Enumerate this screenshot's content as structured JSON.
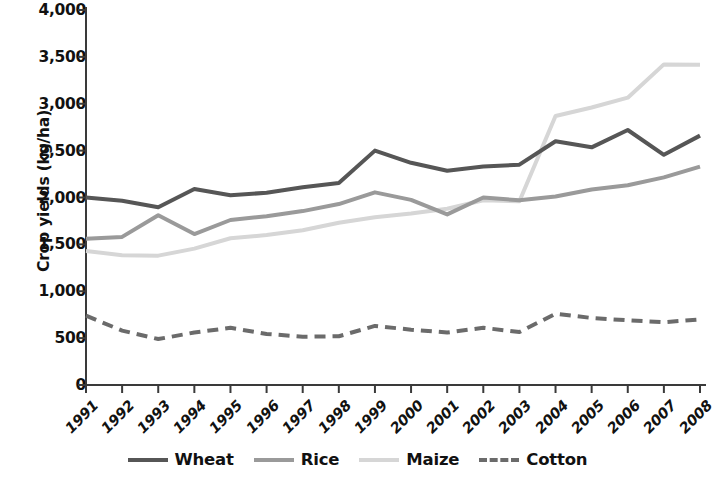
{
  "chart_data": {
    "type": "line",
    "title": "",
    "xlabel": "",
    "ylabel": "Crop yields (kg/ha)",
    "grid": false,
    "legend_position": "bottom",
    "xlim": [
      1991,
      2008
    ],
    "ylim": [
      0,
      4000
    ],
    "y_ticks": [
      0,
      500,
      1000,
      1500,
      2000,
      2500,
      3000,
      3500,
      4000
    ],
    "y_tick_labels": [
      "0",
      "500",
      "1,000",
      "1,500",
      "2,000",
      "2,500",
      "3,000",
      "3,500",
      "4,000"
    ],
    "categories": [
      "1991",
      "1992",
      "1993",
      "1994",
      "1995",
      "1996",
      "1997",
      "1998",
      "1999",
      "2000",
      "2001",
      "2002",
      "2003",
      "2004",
      "2005",
      "2006",
      "2007",
      "2008"
    ],
    "series": [
      {
        "name": "Wheat",
        "color": "#565656",
        "style": "solid",
        "width": 4,
        "values": [
          2000,
          1965,
          1895,
          2090,
          2025,
          2050,
          2110,
          2155,
          2500,
          2370,
          2285,
          2330,
          2350,
          2600,
          2535,
          2720,
          2455,
          2660
        ]
      },
      {
        "name": "Rice",
        "color": "#9a9a9a",
        "style": "solid",
        "width": 4,
        "values": [
          1560,
          1580,
          1810,
          1610,
          1760,
          1800,
          1855,
          1930,
          2055,
          1975,
          1820,
          2000,
          1970,
          2010,
          2085,
          2130,
          2215,
          2330
        ]
      },
      {
        "name": "Maize",
        "color": "#d6d6d6",
        "style": "solid",
        "width": 4,
        "values": [
          1430,
          1385,
          1380,
          1455,
          1565,
          1600,
          1650,
          1730,
          1790,
          1830,
          1880,
          1970,
          1960,
          2870,
          2960,
          3065,
          3420,
          3415
        ]
      },
      {
        "name": "Cotton",
        "color": "#6b6b6b",
        "style": "dashed",
        "width": 4,
        "values": [
          740,
          580,
          490,
          560,
          610,
          545,
          515,
          520,
          630,
          590,
          560,
          610,
          565,
          760,
          715,
          690,
          670,
          700
        ]
      }
    ]
  },
  "legend": {
    "items": [
      {
        "label": "Wheat",
        "color": "#565656",
        "style": "solid"
      },
      {
        "label": "Rice",
        "color": "#9a9a9a",
        "style": "solid"
      },
      {
        "label": "Maize",
        "color": "#d6d6d6",
        "style": "solid"
      },
      {
        "label": "Cotton",
        "color": "#6b6b6b",
        "style": "dashed"
      }
    ]
  },
  "axis": {
    "y_title": "Crop yields (kg/ha)",
    "axis_color": "#3a3a3a"
  }
}
